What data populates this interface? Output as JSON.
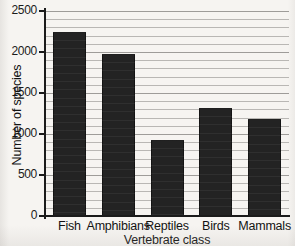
{
  "chart_data": {
    "type": "bar",
    "title": "",
    "xlabel": "Vertebrate class",
    "ylabel": "Number of species",
    "categories": [
      "Fish",
      "Amphibians",
      "Reptiles",
      "Birds",
      "Mammals"
    ],
    "values": [
      2240,
      1975,
      925,
      1320,
      1180
    ],
    "ylim": [
      0,
      2500
    ],
    "yticks": [
      0,
      500,
      1000,
      1500,
      2000,
      2500
    ],
    "ytick_labels": [
      "0",
      "500",
      "1000",
      "1500",
      "2000",
      "2500"
    ],
    "grid": true,
    "grid_interval": 100,
    "legend": "none",
    "bar_color": "#232323",
    "grid_color": "#b9b7b4",
    "axis_color": "#1b1b1b",
    "background_color": "#f6f4f1"
  }
}
